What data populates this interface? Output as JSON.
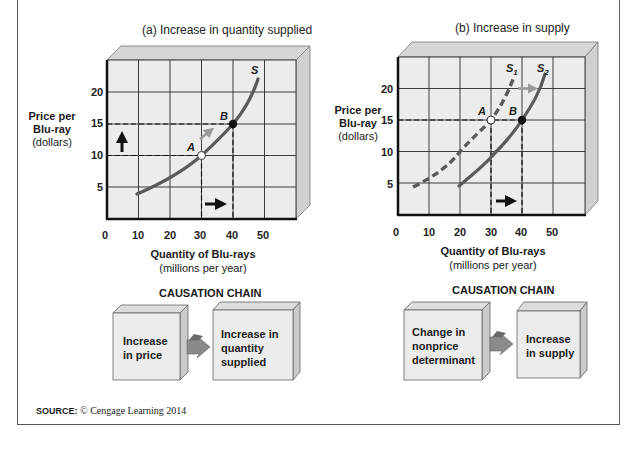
{
  "panels": [
    {
      "title": "(a) Increase in quantity supplied",
      "ylabel_bold_1": "Price per",
      "ylabel_bold_2": "Blu-ray",
      "ylabel_unit": "(dollars)",
      "xlabel_bold": "Quantity of Blu-rays",
      "xlabel_unit": "(millions per year)",
      "x_ticks": [
        "0",
        "10",
        "20",
        "30",
        "40",
        "50"
      ],
      "y_ticks": [
        "5",
        "10",
        "15",
        "20"
      ],
      "curve_labels": [
        "S"
      ],
      "point_labels": [
        "A",
        "B"
      ],
      "chain_title": "CAUSATION CHAIN",
      "chain_boxes": [
        {
          "lines": [
            "Increase",
            "in price"
          ]
        },
        {
          "lines": [
            "Increase in",
            "quantity",
            "supplied"
          ]
        }
      ]
    },
    {
      "title": "(b) Increase in supply",
      "ylabel_bold_1": "Price per",
      "ylabel_bold_2": "Blu-ray",
      "ylabel_unit": "(dollars)",
      "xlabel_bold": "Quantity of Blu-rays",
      "xlabel_unit": "(millions per year)",
      "x_ticks": [
        "0",
        "10",
        "20",
        "30",
        "40",
        "50"
      ],
      "y_ticks": [
        "5",
        "10",
        "15",
        "20"
      ],
      "curve_labels": [
        "S1",
        "S2"
      ],
      "point_labels": [
        "A",
        "B"
      ],
      "chain_title": "CAUSATION CHAIN",
      "chain_boxes": [
        {
          "lines": [
            "Change in",
            "nonprice",
            "determinant"
          ]
        },
        {
          "lines": [
            "Increase",
            "in supply"
          ]
        }
      ]
    }
  ],
  "source": {
    "label": "SOURCE:",
    "text": "© Cengage Learning 2014"
  },
  "colors": {
    "curve": "#5a5a5a",
    "grid": "#2a2a2a",
    "panel_bg": "#ececec",
    "shift_arrow": "#9a9a9a",
    "axis": "#111111"
  },
  "chart_data": [
    {
      "type": "line",
      "title": "(a) Increase in quantity supplied",
      "xlabel": "Quantity of Blu-rays (millions per year)",
      "ylabel": "Price per Blu-ray (dollars)",
      "xlim": [
        0,
        60
      ],
      "ylim": [
        0,
        25
      ],
      "x_ticks": [
        0,
        10,
        20,
        30,
        40,
        50
      ],
      "y_ticks": [
        5,
        10,
        15,
        20
      ],
      "grid": true,
      "series": [
        {
          "name": "S",
          "style": "solid",
          "x": [
            10,
            20,
            30,
            40,
            48
          ],
          "y": [
            4,
            6.5,
            10,
            15,
            22
          ]
        }
      ],
      "points": [
        {
          "label": "A",
          "x": 30,
          "y": 10,
          "marker": "open"
        },
        {
          "label": "B",
          "x": 40,
          "y": 15,
          "marker": "filled"
        }
      ],
      "annotations": [
        "up arrow: price rises 10 → 15",
        "right arrow: quantity rises 30 → 40",
        "movement along S from A to B"
      ]
    },
    {
      "type": "line",
      "title": "(b) Increase in supply",
      "xlabel": "Quantity of Blu-rays (millions per year)",
      "ylabel": "Price per Blu-ray (dollars)",
      "xlim": [
        0,
        60
      ],
      "ylim": [
        0,
        25
      ],
      "x_ticks": [
        0,
        10,
        20,
        30,
        40,
        50
      ],
      "y_ticks": [
        5,
        10,
        15,
        20
      ],
      "grid": true,
      "series": [
        {
          "name": "S1",
          "style": "dashed",
          "x": [
            5,
            10,
            20,
            30,
            37
          ],
          "y": [
            5,
            6.5,
            10,
            15,
            21
          ]
        },
        {
          "name": "S2",
          "style": "solid",
          "x": [
            20,
            30,
            40,
            47
          ],
          "y": [
            5,
            9.5,
            15,
            22
          ]
        }
      ],
      "points": [
        {
          "label": "A",
          "x": 30,
          "y": 15,
          "marker": "open"
        },
        {
          "label": "B",
          "x": 40,
          "y": 15,
          "marker": "filled"
        }
      ],
      "annotations": [
        "gray arrow: supply shifts right from S1 to S2",
        "right arrow: quantity rises 30 → 40 at price 15"
      ]
    }
  ]
}
